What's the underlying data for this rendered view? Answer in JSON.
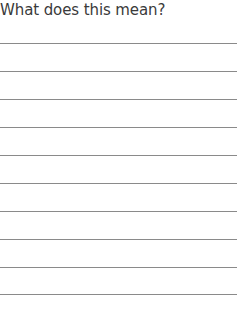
{
  "worksheet": {
    "prompt": "What does this mean?",
    "answer_lines": 10,
    "line_color": "#8a8a8a",
    "text_color": "#3a3a3a"
  }
}
